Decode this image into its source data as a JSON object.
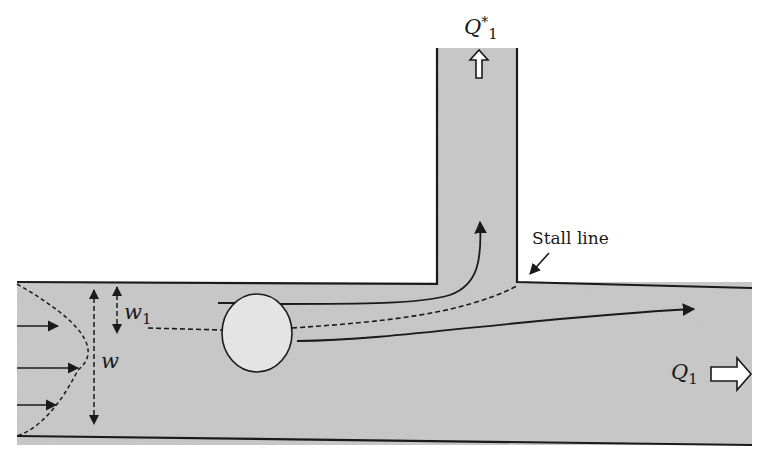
{
  "diagram": {
    "type": "T-junction channel flow (particle at bifurcation)",
    "colors": {
      "fluid_fill": "#c9c9c9",
      "wall": "#1a1a1a",
      "particle_fill": "#e4e4e4",
      "background": "#ffffff"
    },
    "labels": {
      "branch_flow": {
        "base": "Q",
        "sup": "*",
        "sub": "1"
      },
      "main_flow": {
        "base": "Q",
        "sub": "1"
      },
      "channel_width": {
        "base": "w"
      },
      "sub_width": {
        "base": "w",
        "sub": "1"
      },
      "stall_line": "Stall line"
    },
    "elements": [
      "main channel (horizontal)",
      "side branch (vertical, upward)",
      "parabolic inlet velocity profile with 3 arrows",
      "particle (circle) at dividing streamline",
      "dividing streamline (dashed) ending at stall line",
      "streamline into branch",
      "streamline continuing in main channel",
      "outlet arrows for Q*1 and Q1"
    ]
  }
}
